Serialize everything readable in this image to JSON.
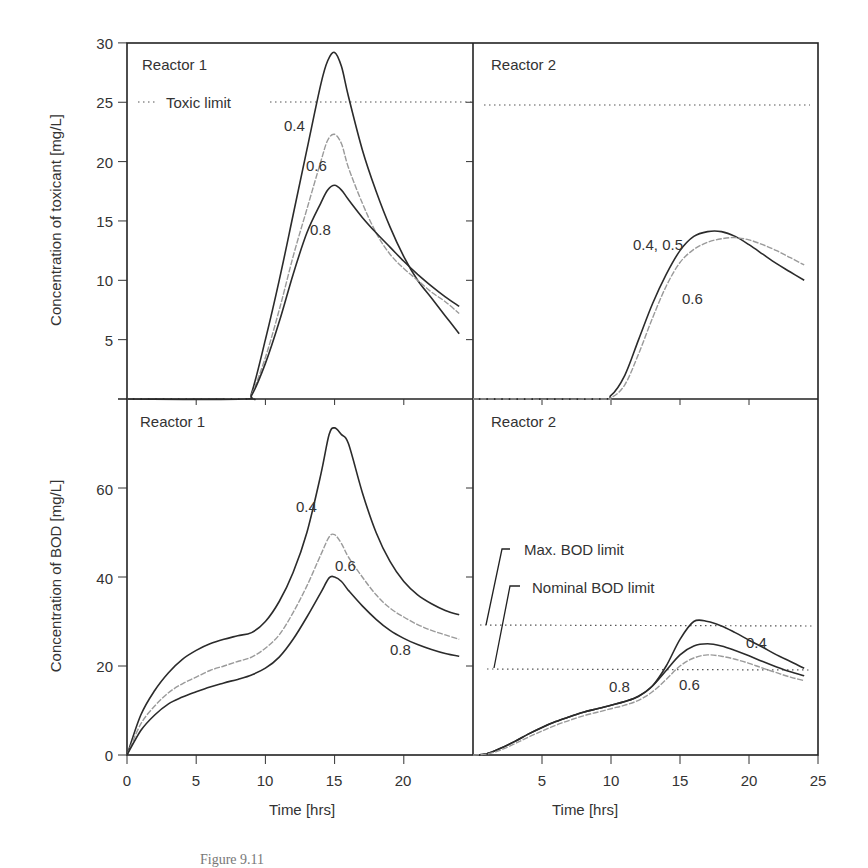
{
  "figure": {
    "caption": "Figure 9.11"
  },
  "colors": {
    "dark": "#2b2b2b",
    "light": "#9a9a9a",
    "frame": "#222222",
    "limit": "#555555"
  },
  "chart_data": [
    {
      "type": "line",
      "panel": "top-left",
      "title": "Reactor 1",
      "xlabel": "",
      "ylabel": "Concentration of toxicant [mg/L]",
      "xlim": [
        0,
        25
      ],
      "ylim": [
        0,
        30
      ],
      "yticks": [
        5,
        10,
        15,
        20,
        25,
        30
      ],
      "xticks": [
        5,
        10,
        15,
        20
      ],
      "grid": false,
      "legend": [
        {
          "label": "Toxic limit",
          "style": "dotted"
        }
      ],
      "hlines": [
        {
          "name": "Toxic limit",
          "y": 25,
          "style": "dotted"
        }
      ],
      "series": [
        {
          "name": "0.4",
          "color": "dark",
          "x": [
            0,
            8.5,
            9,
            10,
            11,
            12,
            13,
            14,
            14.5,
            15,
            15.5,
            16,
            17,
            18,
            19,
            20,
            21,
            22,
            23,
            24
          ],
          "values": [
            0,
            0,
            0.5,
            5,
            10,
            15.5,
            21,
            26.5,
            28.5,
            29.2,
            28,
            25.5,
            21,
            17.5,
            14.5,
            12,
            10,
            8.5,
            7,
            5.5
          ]
        },
        {
          "name": "0.6",
          "color": "light",
          "x": [
            0,
            8.5,
            9,
            10,
            11,
            12,
            13,
            14,
            14.5,
            15,
            15.5,
            16,
            17,
            18,
            19,
            20,
            21,
            22,
            23,
            24
          ],
          "values": [
            0,
            0,
            0.4,
            3.5,
            7.5,
            12,
            16,
            20,
            21.8,
            22.3,
            21.5,
            19.5,
            16.5,
            14,
            12.2,
            11,
            10,
            9,
            8.2,
            7.2
          ]
        },
        {
          "name": "0.8",
          "color": "dark",
          "x": [
            0,
            8.5,
            9,
            10,
            11,
            12,
            13,
            14,
            14.5,
            15,
            15.5,
            16,
            17,
            18,
            19,
            20,
            21,
            22,
            23,
            24
          ],
          "values": [
            0,
            0,
            0.3,
            3,
            6.5,
            10.5,
            14,
            16.5,
            17.6,
            18,
            17.6,
            16.8,
            15.3,
            14,
            12.8,
            11.6,
            10.5,
            9.5,
            8.6,
            7.8
          ]
        }
      ],
      "annotations": [
        "0.4",
        "0.6",
        "0.8"
      ]
    },
    {
      "type": "line",
      "panel": "top-right",
      "title": "Reactor 2",
      "xlim": [
        0,
        25
      ],
      "ylim": [
        0,
        30
      ],
      "hlines": [
        {
          "name": "Toxic limit",
          "y": 25,
          "style": "dotted"
        }
      ],
      "series": [
        {
          "name": "0.4, 0.5",
          "color": "dark",
          "x": [
            0,
            9,
            10,
            11,
            12,
            13,
            14,
            15,
            16,
            17,
            18,
            19,
            20,
            21,
            22,
            23,
            24
          ],
          "values": [
            0,
            0,
            0.3,
            2,
            5,
            8,
            10.5,
            12.5,
            13.7,
            14.1,
            14.1,
            13.7,
            13,
            12.2,
            11.4,
            10.7,
            10
          ]
        },
        {
          "name": "0.6",
          "color": "light",
          "x": [
            0,
            9,
            10,
            11,
            12,
            13,
            14,
            15,
            16,
            17,
            18,
            19,
            20,
            21,
            22,
            23,
            24
          ],
          "values": [
            0,
            0,
            0.1,
            1.2,
            3.8,
            6.8,
            9.5,
            11.5,
            12.6,
            13.2,
            13.5,
            13.6,
            13.4,
            13,
            12.5,
            11.9,
            11.3
          ]
        }
      ],
      "annotations": [
        "0.4, 0.5",
        "0.6"
      ]
    },
    {
      "type": "line",
      "panel": "bottom-left",
      "title": "Reactor 1",
      "xlabel": "Time [hrs]",
      "ylabel": "Concentration of BOD [mg/L]",
      "xlim": [
        0,
        25
      ],
      "ylim": [
        0,
        80
      ],
      "xticks": [
        0,
        5,
        10,
        15,
        20
      ],
      "yticks": [
        0,
        20,
        40,
        60
      ],
      "series": [
        {
          "name": "0.4",
          "color": "dark",
          "x": [
            0,
            1,
            2,
            3,
            4,
            5,
            6,
            7,
            8,
            9,
            10,
            11,
            12,
            13,
            14,
            14.6,
            15,
            15.5,
            16,
            17,
            18,
            19,
            20,
            21,
            22,
            23,
            24
          ],
          "values": [
            0,
            9,
            14.5,
            18.5,
            21.5,
            23.5,
            25,
            26,
            26.8,
            27.5,
            30,
            34.5,
            41,
            50,
            63,
            72,
            73.5,
            72,
            70,
            59,
            50,
            43.5,
            39,
            36,
            34,
            32.5,
            31.5
          ]
        },
        {
          "name": "0.6",
          "color": "light",
          "x": [
            0,
            1,
            2,
            3,
            4,
            5,
            6,
            7,
            8,
            9,
            10,
            11,
            12,
            13,
            14,
            14.6,
            15,
            15.5,
            16,
            17,
            18,
            19,
            20,
            21,
            22,
            23,
            24
          ],
          "values": [
            0,
            7,
            11,
            14,
            16,
            17.5,
            19,
            20,
            21,
            22,
            24,
            27,
            32,
            38,
            45,
            49,
            49.5,
            47.5,
            44.5,
            40,
            36,
            33,
            31,
            29.3,
            28,
            27,
            26
          ]
        },
        {
          "name": "0.8",
          "color": "dark",
          "x": [
            0,
            1,
            2,
            3,
            4,
            5,
            6,
            7,
            8,
            9,
            10,
            11,
            12,
            13,
            14,
            14.6,
            15,
            15.5,
            16,
            17,
            18,
            19,
            20,
            21,
            22,
            23,
            24
          ],
          "values": [
            0,
            5.5,
            9,
            11.5,
            13,
            14.2,
            15.3,
            16.2,
            17,
            18,
            19.5,
            22,
            26,
            31,
            36.5,
            39.8,
            40,
            39,
            37,
            33.5,
            30.5,
            28,
            26.2,
            24.8,
            23.7,
            22.8,
            22.2
          ]
        }
      ],
      "annotations": [
        "0.4",
        "0.6",
        "0.8"
      ]
    },
    {
      "type": "line",
      "panel": "bottom-right",
      "title": "Reactor 2",
      "xlabel": "Time [hrs]",
      "xlim": [
        0,
        25
      ],
      "ylim": [
        0,
        80
      ],
      "xticks": [
        5,
        10,
        15,
        20,
        25
      ],
      "hlines": [
        {
          "name": "Max. BOD limit",
          "y": 30,
          "style": "dotted"
        },
        {
          "name": "Nominal BOD limit",
          "y": 20,
          "style": "dotted"
        }
      ],
      "series": [
        {
          "name": "0.4",
          "color": "dark",
          "x": [
            0,
            1,
            2,
            3,
            4,
            5,
            6,
            7,
            8,
            9,
            10,
            11,
            12,
            13,
            14,
            15,
            16,
            17,
            18,
            19,
            20,
            21,
            22,
            23,
            24
          ],
          "values": [
            0,
            0.3,
            1.5,
            3,
            4.7,
            6.2,
            7.5,
            8.6,
            9.6,
            10.4,
            11.2,
            12,
            13.2,
            15.5,
            20,
            26,
            30,
            30,
            29,
            27.5,
            25.8,
            24.2,
            22.5,
            21,
            19.5
          ]
        },
        {
          "name": "0.8",
          "color": "dark",
          "x": [
            0,
            1,
            2,
            3,
            4,
            5,
            6,
            7,
            8,
            9,
            10,
            11,
            12,
            13,
            14,
            15,
            16,
            17,
            18,
            19,
            20,
            21,
            22,
            23,
            24
          ],
          "values": [
            0,
            0.3,
            1.5,
            3,
            4.7,
            6.2,
            7.5,
            8.6,
            9.6,
            10.4,
            11.2,
            12,
            13.2,
            15.5,
            19,
            22.5,
            24.5,
            25,
            24.5,
            23.5,
            22.3,
            21,
            19.8,
            18.7,
            17.8
          ]
        },
        {
          "name": "0.6",
          "color": "light",
          "x": [
            0,
            1,
            2,
            3,
            4,
            5,
            6,
            7,
            8,
            9,
            10,
            11,
            12,
            13,
            14,
            15,
            16,
            17,
            18,
            19,
            20,
            21,
            22,
            23,
            24
          ],
          "values": [
            0,
            0.2,
            1.1,
            2.5,
            4,
            5.4,
            6.7,
            7.8,
            8.8,
            9.6,
            10.4,
            11.2,
            12.3,
            14.2,
            17,
            20,
            21.8,
            22.5,
            22.2,
            21.5,
            20.6,
            19.5,
            18.5,
            17.5,
            16.7
          ]
        }
      ],
      "annotations": [
        "0.4",
        "0.8",
        "0.6",
        "Max. BOD limit",
        "Nominal BOD limit"
      ]
    }
  ],
  "panels": {
    "tl": {
      "title": "Reactor 1",
      "legend_label": "Toxic limit",
      "ylabel": "Concentration of toxicant [mg/L]",
      "labels": {
        "a": "0.4",
        "b": "0.6",
        "c": "0.8"
      }
    },
    "tr": {
      "title": "Reactor 2",
      "labels": {
        "a": "0.4, 0.5",
        "b": "0.6"
      }
    },
    "bl": {
      "title": "Reactor 1",
      "ylabel": "Concentration of BOD [mg/L]",
      "xlabel": "Time [hrs]",
      "labels": {
        "a": "0.4",
        "b": "0.6",
        "c": "0.8"
      }
    },
    "br": {
      "title": "Reactor 2",
      "xlabel": "Time [hrs]",
      "max_limit": "Max. BOD limit",
      "nominal_limit": "Nominal BOD limit",
      "labels": {
        "a": "0.4",
        "b": "0.8",
        "c": "0.6"
      }
    }
  },
  "ticks": {
    "tox_y": [
      "5",
      "10",
      "15",
      "20",
      "25",
      "30"
    ],
    "bod_y": [
      "0",
      "20",
      "40",
      "60"
    ],
    "left_x": [
      "0",
      "5",
      "10",
      "15",
      "20"
    ],
    "right_x": [
      "5",
      "10",
      "15",
      "20",
      "25"
    ]
  }
}
